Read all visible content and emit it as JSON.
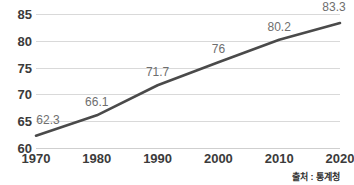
{
  "chart_data": {
    "type": "line",
    "title": "",
    "subtitle": "",
    "xlabel": "",
    "ylabel": "",
    "categories": [
      "1970",
      "1980",
      "1990",
      "2000",
      "2010",
      "2020"
    ],
    "x": [
      1970,
      1980,
      1990,
      2000,
      2010,
      2020
    ],
    "values": [
      62.3,
      66.1,
      71.7,
      76,
      80.2,
      83.3
    ],
    "point_labels": [
      "62.3",
      "66.1",
      "71.7",
      "76",
      "80.2",
      "83.3"
    ],
    "series": [
      {
        "name": "",
        "values": [
          62.3,
          66.1,
          71.7,
          76,
          80.2,
          83.3
        ]
      }
    ],
    "ylim": [
      60,
      85
    ],
    "xlim": [
      1970,
      2020
    ],
    "yticks": [
      85,
      80,
      75,
      70,
      65,
      60
    ],
    "ytick_labels": [
      "85",
      "80",
      "75",
      "70",
      "65",
      "60"
    ],
    "xticks": [
      1970,
      1980,
      1990,
      2000,
      2010,
      2020
    ],
    "xtick_labels": [
      "1970",
      "1980",
      "1990",
      "2000",
      "2010",
      "2020"
    ],
    "grid": "horizontal",
    "legend": "none",
    "line_color": "#4a4a4a",
    "grid_color": "#d9d9d9",
    "label_color": "#6e6e6e",
    "axis_text_color": "#3b3b3b",
    "background": "#ffffff",
    "annotations": [
      {
        "name": "source",
        "text": "출처 : 통계청",
        "position": "bottom-right"
      }
    ]
  },
  "source": {
    "text": "출처 : 통계청"
  }
}
